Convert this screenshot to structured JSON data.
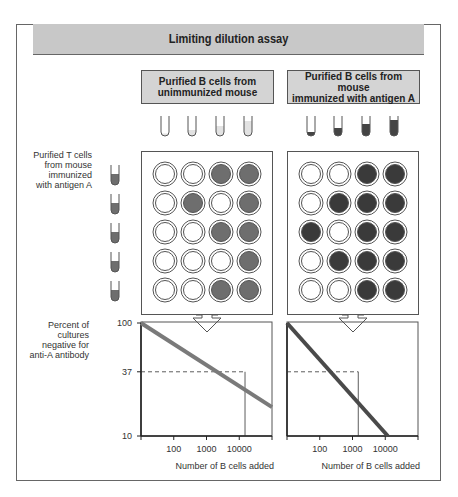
{
  "title": "Limiting dilution assay",
  "colors": {
    "header_bg": "#c8c8c8",
    "box_bg": "#d4d4d4",
    "unimmunized_fill": "#6e6e6e",
    "immunized_fill": "#3c3c3c",
    "tcell_fill": "#6e6e6e",
    "left_line": "#7a7a7a",
    "right_line": "#4a4a4a"
  },
  "panels": [
    {
      "source_label": "Purified B cells from\nunimmunized mouse",
      "tube_fill_levels": [
        0.12,
        0.3,
        0.5,
        0.75
      ],
      "tube_fill_color": "#e2e2e2",
      "wells": [
        [
          0,
          0,
          1,
          1
        ],
        [
          0,
          1,
          0,
          1
        ],
        [
          0,
          0,
          1,
          1
        ],
        [
          0,
          0,
          0,
          1
        ],
        [
          0,
          0,
          1,
          1
        ]
      ],
      "well_fill": "#6e6e6e"
    },
    {
      "source_label": "Purified B cells from mouse\nimmunized with antigen A",
      "tube_fill_levels": [
        0.2,
        0.4,
        0.6,
        0.8
      ],
      "tube_fill_color": "#444444",
      "wells": [
        [
          0,
          0,
          1,
          1
        ],
        [
          0,
          1,
          1,
          1
        ],
        [
          1,
          0,
          1,
          1
        ],
        [
          0,
          1,
          1,
          1
        ],
        [
          0,
          0,
          1,
          1
        ]
      ],
      "well_fill": "#3a3a3a"
    }
  ],
  "tcell_label": "Purified T cells\nfrom mouse\nimmunized\nwith antigen A",
  "tcell_tube_count": 5,
  "yaxis_label": "Percent of\ncultures\nnegative for\nanti-A antibody",
  "xaxis_label": "Number of B cells added",
  "chart_data": [
    {
      "type": "line",
      "title": "Unimmunized mouse B cells",
      "xlabel": "Number of B cells added",
      "ylabel": "Percent of cultures negative for anti-A antibody",
      "x_scale": "log",
      "y_scale": "log",
      "x_ticks": [
        "100",
        "1000",
        "10000"
      ],
      "y_ticks": [
        "100",
        "37",
        "10"
      ],
      "ylim": [
        10,
        100
      ],
      "series": [
        {
          "name": "unimmunized",
          "x": [
            10,
            100000
          ],
          "y": [
            100,
            18
          ]
        }
      ],
      "reference_line": {
        "y": 37,
        "x": 15000,
        "style": "dashed"
      }
    },
    {
      "type": "line",
      "title": "Immunized mouse B cells",
      "xlabel": "Number of B cells added",
      "ylabel": "Percent of cultures negative for anti-A antibody",
      "x_scale": "log",
      "y_scale": "log",
      "x_ticks": [
        "100",
        "1000",
        "10000"
      ],
      "y_ticks": [
        "100",
        "37",
        "10"
      ],
      "ylim": [
        10,
        100
      ],
      "series": [
        {
          "name": "immunized",
          "x": [
            10,
            12000
          ],
          "y": [
            100,
            10
          ]
        }
      ],
      "reference_line": {
        "y": 37,
        "x": 1500,
        "style": "dashed"
      }
    }
  ]
}
